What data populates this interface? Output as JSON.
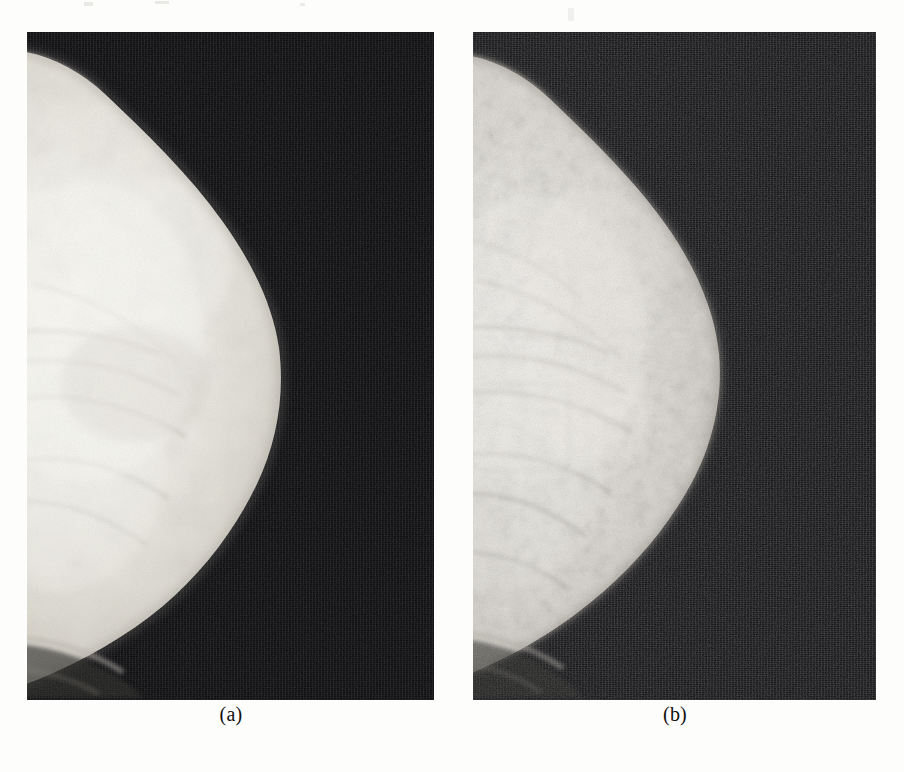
{
  "document": {
    "type": "scanned-figure",
    "page_background": "#fdfdfc",
    "figure_kind": "side-by-side medical radiograph comparison"
  },
  "figure": {
    "panels": [
      {
        "id": "panel-a",
        "caption": "(a)",
        "modality": "mammogram",
        "view": "mediolateral / craniocaudal breast X-ray",
        "description": "original low-contrast mammogram, smooth bright breast region on a black background",
        "bounds": {
          "x": 27,
          "y": 32,
          "width": 407,
          "height": 668
        },
        "background_color": "#07070a",
        "tissue_bright_color": "#f2f0ea",
        "tissue_mid_color": "#c9c6bd",
        "tissue_edge_color": "#6e6c66",
        "texture_strength": "low",
        "caption_center_x": 231,
        "caption_y": 714
      },
      {
        "id": "panel-b",
        "caption": "(b)",
        "modality": "mammogram",
        "view": "mediolateral / craniocaudal breast X-ray",
        "description": "contrast-enhanced mammogram of the same breast, glandular texture and trabecular detail clearly visible",
        "bounds": {
          "x": 473,
          "y": 32,
          "width": 403,
          "height": 668
        },
        "background_color": "#0a0a0d",
        "tissue_bright_color": "#eceae3",
        "tissue_mid_color": "#bdb9b0",
        "tissue_edge_color": "#5f5d58",
        "texture_strength": "high",
        "caption_center_x": 675,
        "caption_y": 714
      }
    ]
  },
  "artifacts": [
    {
      "x": 84,
      "y": 2,
      "width": 9,
      "height": 4
    },
    {
      "x": 155,
      "y": 1,
      "width": 14,
      "height": 3
    },
    {
      "x": 568,
      "y": 8,
      "width": 6,
      "height": 13
    },
    {
      "x": 300,
      "y": 3,
      "width": 5,
      "height": 3
    }
  ],
  "colors": {
    "page": "#fdfdfc",
    "film_black": "#07070a",
    "tissue_white": "#f3f1ec",
    "caption_text": "#14100e"
  }
}
